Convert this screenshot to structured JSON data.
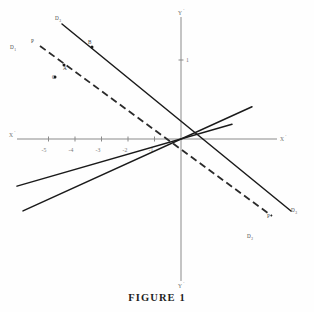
{
  "figure": {
    "caption": "FIGURE 1",
    "axes": {
      "x_positive_label": "X",
      "x_positive_prime": "'",
      "x_negative_label": "X",
      "x_negative_prime": "'",
      "y_positive_label": "Y",
      "y_positive_prime": "'",
      "y_negative_label": "Y",
      "y_negative_prime": "'",
      "x_ticks": [
        {
          "label": "-5",
          "value": -5
        },
        {
          "label": "-4",
          "value": -4
        },
        {
          "label": "-3",
          "value": -3
        },
        {
          "label": "-2",
          "value": -2
        },
        {
          "label": "-1",
          "value": -1
        }
      ],
      "y_ticks": [
        {
          "label": "1",
          "value": 1
        }
      ]
    },
    "line_labels": [
      {
        "name": "D3",
        "base": "D",
        "sub": "3"
      },
      {
        "name": "D1",
        "base": "D",
        "sub": "1"
      },
      {
        "name": "P_upper",
        "base": "P",
        "sub": ""
      },
      {
        "name": "D2",
        "base": "D",
        "sub": "2"
      },
      {
        "name": "D3_right",
        "base": "D",
        "sub": "3"
      },
      {
        "name": "P_lower",
        "base": "P",
        "sub": ""
      }
    ],
    "point_labels": [
      {
        "name": "A",
        "label": "A"
      },
      {
        "name": "B",
        "label": "B"
      },
      {
        "name": "C",
        "label": "C"
      }
    ]
  },
  "chart_data": {
    "type": "line",
    "title": "FIGURE 1",
    "xlabel": "X",
    "ylabel": "Y",
    "grid": false,
    "legend": "none",
    "xlim": [
      -6.1,
      3.1
    ],
    "ylim": [
      -3.2,
      3.2
    ],
    "origin_px": [
      181,
      139
    ],
    "x_unit_px": 26.5,
    "y_unit_px": 43,
    "series": [
      {
        "name": "D1",
        "style": "solid",
        "label": "D₁",
        "slope_px": -0.2875,
        "endpoints_px": [
          [
            17,
            186.1
          ],
          [
            232,
            124.4
          ]
        ],
        "end_labels": [
          {
            "text": "D₁",
            "at_px": [
              12,
              47
            ]
          }
        ]
      },
      {
        "name": "D2",
        "style": "solid",
        "label": "D₂",
        "slope_px": -0.455,
        "endpoints_px": [
          [
            38,
            204
          ],
          [
            252,
            236
          ]
        ],
        "end_labels": [
          {
            "text": "D₂",
            "at_px": [
              249,
              232
            ]
          }
        ]
      },
      {
        "name": "D3",
        "style": "solid",
        "label": "D₃",
        "slope_px": -0.52,
        "endpoints_px": [
          [
            62,
            24
          ],
          [
            291,
            211
          ]
        ],
        "end_labels": [
          {
            "text": "D₃",
            "at_px": [
              57,
              18
            ]
          },
          {
            "text": "D₃",
            "at_px": [
              292,
              210
            ]
          }
        ]
      },
      {
        "name": "P",
        "style": "dashed",
        "label": "P",
        "slope_px": -0.38,
        "endpoints_px": [
          [
            40,
            46
          ],
          [
            272,
            216
          ]
        ],
        "end_labels": [
          {
            "text": "P",
            "at_px": [
              33,
              41
            ]
          },
          {
            "text": "P",
            "at_px": [
              268,
              214
            ]
          }
        ]
      }
    ],
    "points": [
      {
        "label": "A",
        "px": [
          64,
          66
        ],
        "on_series": "P"
      },
      {
        "label": "B",
        "px": [
          92,
          48
        ],
        "on_series": "D3"
      },
      {
        "label": "C",
        "px": [
          55,
          78
        ],
        "on_series": "D1"
      }
    ]
  }
}
